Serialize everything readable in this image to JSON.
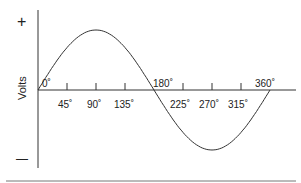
{
  "chart_data": {
    "type": "line",
    "title": "",
    "xlabel": "",
    "ylabel": "Volts",
    "y_markers": {
      "positive": "+",
      "negative": "—"
    },
    "x_tick_labels": [
      "0˚",
      "45˚",
      "90˚",
      "135˚",
      "180˚",
      "225˚",
      "270˚",
      "315˚",
      "360˚"
    ],
    "x": [
      0,
      45,
      90,
      135,
      180,
      225,
      270,
      315,
      360
    ],
    "series": [
      {
        "name": "sine wave",
        "values": [
          0,
          0.707,
          1,
          0.707,
          0,
          -0.707,
          -1,
          -0.707,
          0
        ]
      }
    ],
    "xlim": [
      0,
      360
    ],
    "ylim": [
      -1,
      1
    ],
    "grid": false
  },
  "labels": {
    "ylabel": "Volts",
    "plus": "+",
    "minus": "—",
    "t0": "0˚",
    "t45": "45˚",
    "t90": "90˚",
    "t135": "135˚",
    "t180": "180˚",
    "t225": "225˚",
    "t270": "270˚",
    "t315": "315˚",
    "t360": "360˚"
  }
}
